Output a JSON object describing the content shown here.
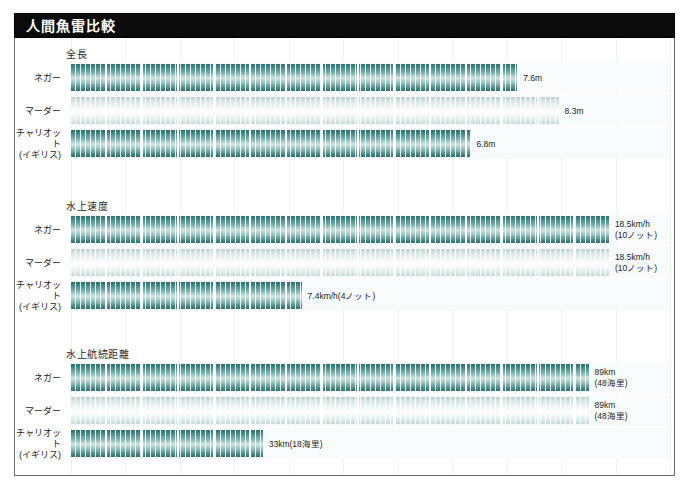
{
  "header": {
    "title": "人間魚雷比較"
  },
  "vehicles": [
    {
      "id": "neger",
      "label": "ネガー",
      "pale": false
    },
    {
      "id": "marder",
      "label": "マーダー",
      "pale": true
    },
    {
      "id": "chariot",
      "label": "チャリオット\n(イギリス)",
      "pale": false
    }
  ],
  "colors": {
    "title_bar_bg": "#0b0b0b",
    "title_text": "#ffffff",
    "frame_border": "#6b6b6b",
    "bar_dark_teal": "#2e6f6c",
    "bar_mid_teal": "#7fb3b0",
    "bar_light": "#cfe3e1",
    "bar_pale": "#e9f3f2",
    "row_wash": "#f7fbfb",
    "gridline": "#eef3f3",
    "text": "#1d1d1d"
  },
  "chart_data": {
    "type": "bar",
    "title": "人間魚雷比較",
    "orientation": "horizontal",
    "grid": true,
    "legend": "none",
    "categories": [
      "ネガー",
      "マーダー",
      "チャリオット(イギリス)"
    ],
    "panels": [
      {
        "id": "length",
        "title": "全長",
        "unit": "m",
        "xlim": [
          0,
          10.2
        ],
        "values": [
          7.6,
          8.3,
          6.8
        ],
        "labels": [
          "7.6m",
          "8.3m",
          "6.8m"
        ]
      },
      {
        "id": "surface-speed",
        "title": "水上速度",
        "unit": "km/h",
        "xlim": [
          0,
          20.6
        ],
        "values": [
          18.5,
          18.5,
          7.4
        ],
        "labels": [
          "18.5km/h\n(10ノット)",
          "18.5km/h\n(10ノット)",
          "7.4km/h(4ノット)"
        ]
      },
      {
        "id": "surface-range",
        "title": "水上航続距離",
        "unit": "km",
        "xlim": [
          0,
          103
        ],
        "values": [
          89,
          89,
          33
        ],
        "labels": [
          "89km\n(48海里)",
          "89km\n(48海里)",
          "33km(18海里)"
        ]
      }
    ]
  },
  "sections": [
    {
      "title": "全長",
      "rows": [
        {
          "label": "ネガー",
          "value_text": "7.6m",
          "pct": 74.5,
          "pale": false
        },
        {
          "label": "マーダー",
          "value_text": "8.3m",
          "pct": 81.4,
          "pale": true
        },
        {
          "label": "チャリオット\n(イギリス)",
          "value_text": "6.8m",
          "pct": 66.7,
          "pale": false
        }
      ]
    },
    {
      "title": "水上速度",
      "rows": [
        {
          "label": "ネガー",
          "value_text": "18.5km/h\n(10ノット)",
          "pct": 89.8,
          "pale": false
        },
        {
          "label": "マーダー",
          "value_text": "18.5km/h\n(10ノット)",
          "pct": 89.8,
          "pale": true
        },
        {
          "label": "チャリオット\n(イギリス)",
          "value_text": "7.4km/h(4ノット)",
          "pct": 38.5,
          "pale": false
        }
      ]
    },
    {
      "title": "水上航続距離",
      "rows": [
        {
          "label": "ネガー",
          "value_text": "89km\n(48海里)",
          "pct": 86.4,
          "pale": false
        },
        {
          "label": "マーダー",
          "value_text": "89km\n(48海里)",
          "pct": 86.4,
          "pale": true
        },
        {
          "label": "チャリオット\n(イギリス)",
          "value_text": "33km(18海里)",
          "pct": 32.0,
          "pale": false
        }
      ]
    }
  ]
}
